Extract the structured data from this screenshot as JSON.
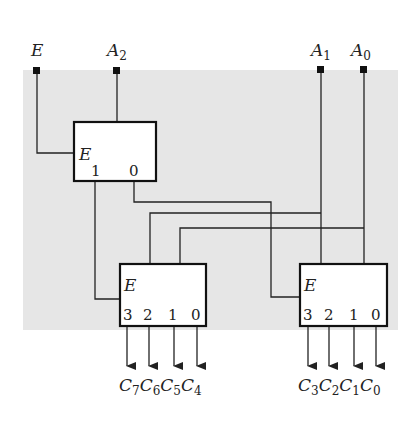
{
  "colors": {
    "background": "#ffffff",
    "panel": "#e6e6e6",
    "wire": "#222222",
    "box_fill": "#ffffff"
  },
  "inputs": [
    {
      "name": "E",
      "sub": ""
    },
    {
      "name": "A",
      "sub": "2"
    },
    {
      "name": "A",
      "sub": "1"
    },
    {
      "name": "A",
      "sub": "0"
    }
  ],
  "decoders": {
    "top": {
      "enable": "E",
      "outputs": [
        "1",
        "0"
      ]
    },
    "bottom_left": {
      "enable": "E",
      "outputs": [
        "3",
        "2",
        "1",
        "0"
      ]
    },
    "bottom_right": {
      "enable": "E",
      "outputs": [
        "3",
        "2",
        "1",
        "0"
      ]
    }
  },
  "outputs_left": [
    {
      "name": "C",
      "sub": "7"
    },
    {
      "name": "C",
      "sub": "6"
    },
    {
      "name": "C",
      "sub": "5"
    },
    {
      "name": "C",
      "sub": "4"
    }
  ],
  "outputs_right": [
    {
      "name": "C",
      "sub": "3"
    },
    {
      "name": "C",
      "sub": "2"
    },
    {
      "name": "C",
      "sub": "1"
    },
    {
      "name": "C",
      "sub": "0"
    }
  ]
}
